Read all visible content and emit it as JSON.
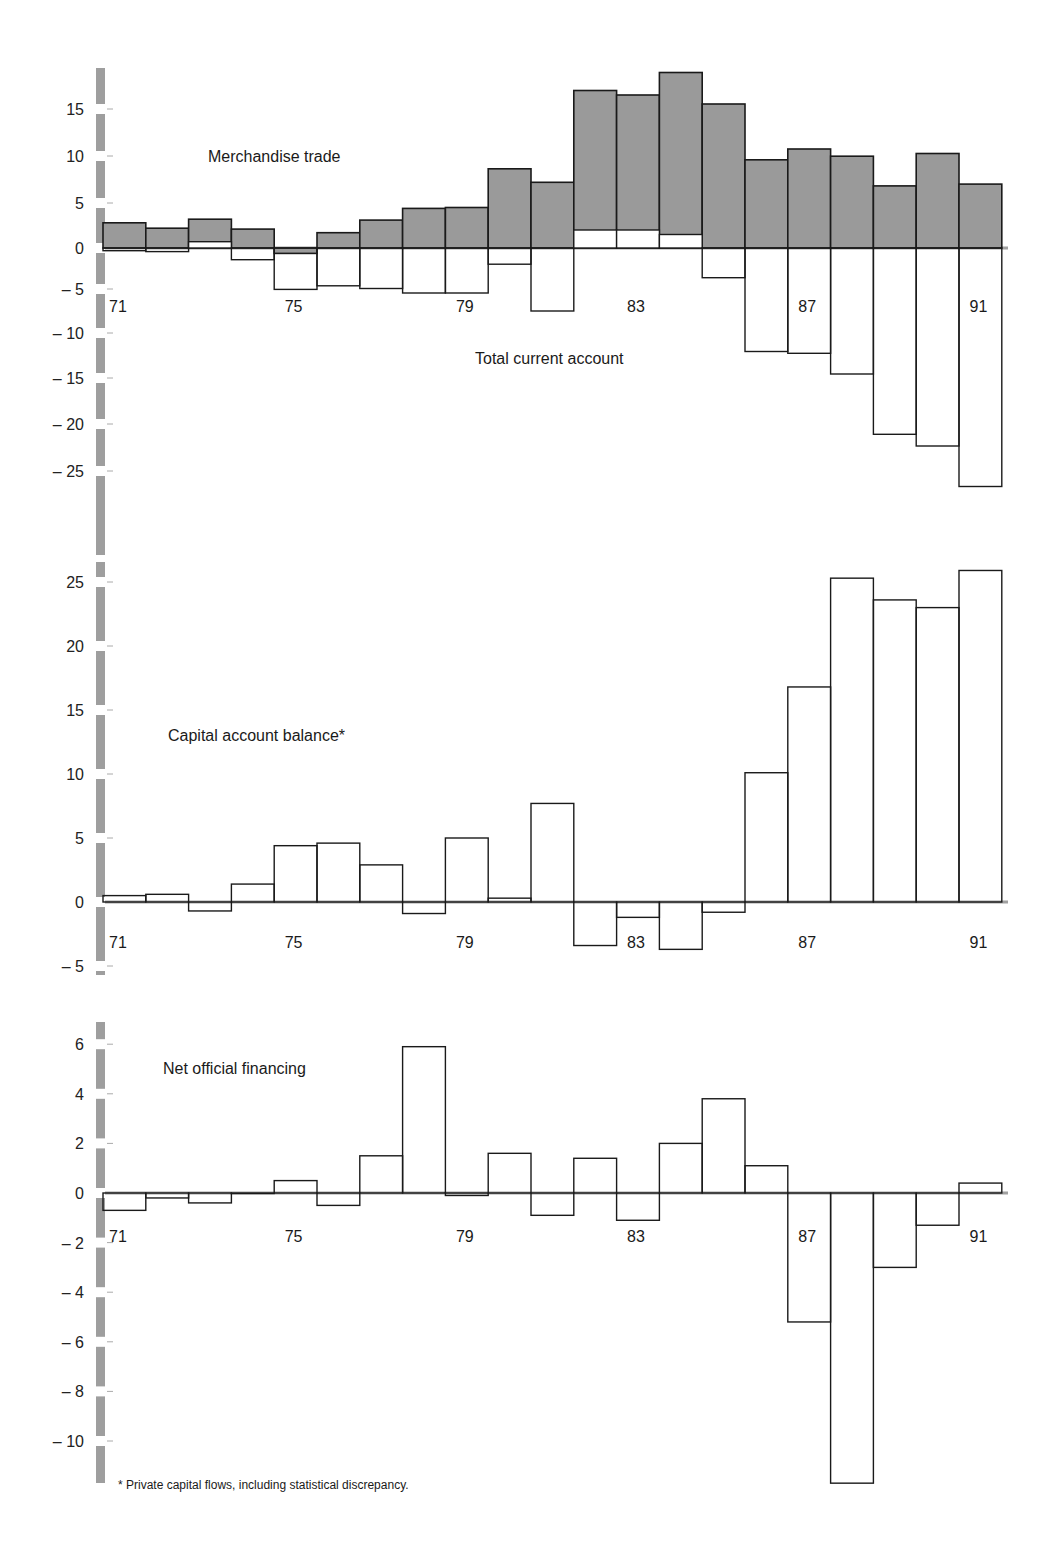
{
  "footnote": "* Private capital flows, including statistical discrepancy.",
  "colors": {
    "axis_bar": "#9e9e9e",
    "merchandise_fill": "#9a9a9a",
    "bar_outline": "#1a1a1a",
    "zero_line": "#a0a0a0",
    "background": "#ffffff"
  },
  "chart_data": [
    {
      "type": "bar",
      "title": "Merchandise trade / Total current account",
      "xlabel": "",
      "ylabel": "",
      "categories": [
        "71",
        "72",
        "73",
        "74",
        "75",
        "76",
        "77",
        "78",
        "79",
        "80",
        "81",
        "82",
        "83",
        "84",
        "85",
        "86",
        "87",
        "88",
        "89",
        "90",
        "91"
      ],
      "x_tick_labels": [
        "71",
        "75",
        "79",
        "83",
        "87",
        "91"
      ],
      "y_ticks": [
        15,
        10,
        5,
        0,
        -5,
        -10,
        -15,
        -20,
        -25
      ],
      "ylim": [
        -28,
        20
      ],
      "grid": false,
      "series": [
        {
          "name": "Merchandise trade",
          "style": "filled-gray",
          "values": [
            2.8,
            2.2,
            3.2,
            2.1,
            -0.6,
            1.7,
            3.1,
            4.4,
            4.5,
            8.8,
            7.3,
            17.5,
            17.0,
            19.5,
            16.0,
            9.8,
            11.0,
            10.2,
            6.9,
            10.5,
            7.1
          ]
        },
        {
          "name": "Total current account",
          "style": "outline",
          "values": [
            -0.3,
            -0.4,
            0.7,
            -1.3,
            -4.6,
            -4.2,
            -4.5,
            -5.0,
            -5.0,
            -1.8,
            -7.0,
            2.0,
            2.0,
            1.5,
            -3.3,
            -11.5,
            -11.7,
            -14.0,
            -20.7,
            -22.0,
            -26.5
          ]
        }
      ],
      "annotations": [
        {
          "text": "Merchandise trade",
          "near": "upper-left"
        },
        {
          "text": "Total current account",
          "near": "below zero, center"
        }
      ]
    },
    {
      "type": "bar",
      "title": "Capital account balance*",
      "xlabel": "",
      "ylabel": "",
      "categories": [
        "71",
        "72",
        "73",
        "74",
        "75",
        "76",
        "77",
        "78",
        "79",
        "80",
        "81",
        "82",
        "83",
        "84",
        "85",
        "86",
        "87",
        "88",
        "89",
        "90",
        "91"
      ],
      "x_tick_labels": [
        "71",
        "75",
        "79",
        "83",
        "87",
        "91"
      ],
      "y_ticks": [
        25,
        20,
        15,
        10,
        5,
        0,
        -5
      ],
      "ylim": [
        -5,
        27
      ],
      "grid": false,
      "series": [
        {
          "name": "Capital account balance*",
          "style": "outline",
          "values": [
            0.5,
            0.6,
            -0.7,
            1.4,
            4.4,
            4.6,
            2.9,
            -0.9,
            5.0,
            0.3,
            7.7,
            -3.4,
            -1.2,
            -3.7,
            -0.8,
            10.1,
            16.8,
            25.3,
            23.6,
            23.0,
            25.9
          ]
        }
      ]
    },
    {
      "type": "bar",
      "title": "Net official financing",
      "xlabel": "",
      "ylabel": "",
      "categories": [
        "71",
        "72",
        "73",
        "74",
        "75",
        "76",
        "77",
        "78",
        "79",
        "80",
        "81",
        "82",
        "83",
        "84",
        "85",
        "86",
        "87",
        "88",
        "89",
        "90",
        "91"
      ],
      "x_tick_labels": [
        "71",
        "75",
        "79",
        "83",
        "87",
        "91"
      ],
      "y_ticks": [
        6,
        4,
        2,
        0,
        -2,
        -4,
        -6,
        -8,
        -10
      ],
      "ylim": [
        -12,
        7
      ],
      "grid": false,
      "series": [
        {
          "name": "Net official financing",
          "style": "outline",
          "values": [
            -0.7,
            -0.2,
            -0.4,
            0.0,
            0.5,
            -0.5,
            1.5,
            5.9,
            -0.1,
            1.6,
            -0.9,
            1.4,
            -1.1,
            2.0,
            3.8,
            1.1,
            -5.2,
            -11.7,
            -3.0,
            -1.3,
            0.4
          ]
        }
      ]
    }
  ],
  "layout": {
    "panels": [
      {
        "zero_y": 248,
        "px_per_unit": 9.0,
        "axis_top": 68,
        "axis_bottom": 555,
        "title_x": 208,
        "title_y": 162,
        "label2": "Total current account",
        "label2_x": 475,
        "label2_y": 364,
        "year_y": 312,
        "tick_y_overrides": {
          "15": 109,
          "10": 156,
          "5": 203,
          "0": 248,
          "-5": 289,
          "-10": 333,
          "-15": 378,
          "-20": 424,
          "-25": 471
        }
      },
      {
        "zero_y": 902,
        "px_per_unit": 12.8,
        "axis_top": 562,
        "axis_bottom": 975,
        "title_x": 168,
        "title_y": 741,
        "year_y": 948
      },
      {
        "zero_y": 1193,
        "px_per_unit": 24.8,
        "axis_top": 1022,
        "axis_bottom": 1483,
        "title_x": 163,
        "title_y": 1074,
        "year_y": 1242
      }
    ],
    "bar_x0": 103,
    "bar_width": 42.8
  }
}
